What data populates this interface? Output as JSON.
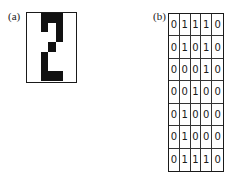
{
  "panels": {
    "a": {
      "label": "(a)"
    },
    "b": {
      "label": "(b)"
    }
  },
  "matrix": [
    [
      0,
      1,
      1,
      1,
      0
    ],
    [
      0,
      1,
      0,
      1,
      0
    ],
    [
      0,
      0,
      0,
      1,
      0
    ],
    [
      0,
      0,
      1,
      0,
      0
    ],
    [
      0,
      1,
      0,
      0,
      0
    ],
    [
      0,
      1,
      0,
      0,
      0
    ],
    [
      0,
      1,
      1,
      1,
      0
    ]
  ],
  "colors": {
    "on": "#111111",
    "off": "#ffffff"
  }
}
